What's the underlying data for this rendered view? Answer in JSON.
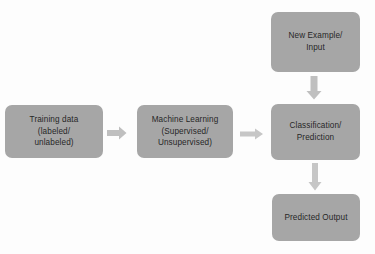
{
  "diagram": {
    "colors": {
      "node_fill": "#a6a6a6",
      "node_text": "#262626",
      "arrow_fill": "#bfbfbf",
      "background": "#fdfdfd"
    },
    "nodes": [
      {
        "id": "training-data",
        "label": "Training data\n(labeled/\nunlabeled)",
        "line1": "Training data",
        "line2": "(labeled/",
        "line3": "unlabeled)"
      },
      {
        "id": "machine-learning",
        "label": "Machine Learning\n(Supervised/\nUnsupervised)",
        "line1": "Machine Learning",
        "line2": "(Supervised/",
        "line3": "Unsupervised)"
      },
      {
        "id": "new-example",
        "label": "New Example/\nInput",
        "line1": "New Example/",
        "line2": "Input"
      },
      {
        "id": "classification",
        "label": "Classification/\nPrediction",
        "line1": "Classification/",
        "line2": "Prediction"
      },
      {
        "id": "predicted-output",
        "label": "Predicted  Output",
        "line1": "Predicted  Output"
      }
    ],
    "arrows": [
      {
        "id": "training-to-ml",
        "from": "training-data",
        "to": "machine-learning",
        "direction": "right"
      },
      {
        "id": "ml-to-classification",
        "from": "machine-learning",
        "to": "classification",
        "direction": "right"
      },
      {
        "id": "example-to-class",
        "from": "new-example",
        "to": "classification",
        "direction": "down"
      },
      {
        "id": "class-to-output",
        "from": "classification",
        "to": "predicted-output",
        "direction": "down"
      }
    ]
  }
}
